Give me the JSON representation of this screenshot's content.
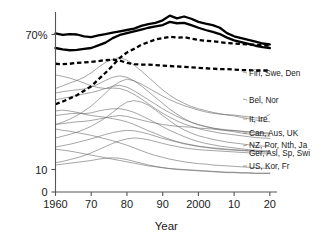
{
  "chart_data": {
    "type": "line",
    "title": "",
    "subtitle": "",
    "xlabel": "Year",
    "ylabel": "",
    "xlim": [
      1960,
      2022
    ],
    "ylim": [
      0,
      80
    ],
    "grid": false,
    "legend_position": "right-inline-labels",
    "x_ticks": [
      {
        "value": 1960,
        "label": "1960"
      },
      {
        "value": 1970,
        "label": "70"
      },
      {
        "value": 1980,
        "label": "80"
      },
      {
        "value": 1990,
        "label": "90"
      },
      {
        "value": 2000,
        "label": "2000"
      },
      {
        "value": 2010,
        "label": "10"
      },
      {
        "value": 2020,
        "label": "20"
      }
    ],
    "y_ticks": [
      {
        "value": 70,
        "label": "70%"
      },
      {
        "value": 10,
        "label": "10"
      },
      {
        "value": 0,
        "label": "0"
      }
    ],
    "x": [
      1960,
      1962,
      1964,
      1966,
      1968,
      1970,
      1972,
      1974,
      1976,
      1978,
      1980,
      1982,
      1984,
      1986,
      1988,
      1990,
      1992,
      1994,
      1996,
      1998,
      2000,
      2002,
      2004,
      2006,
      2008,
      2010,
      2012,
      2014,
      2016,
      2018,
      2020
    ],
    "series": [
      {
        "name": "Fin, Swe, Den",
        "label": "Fin, Swe, Den",
        "style": "thick-solid",
        "emphasis": true,
        "values": [
          70.5,
          69.8,
          70.2,
          70.0,
          69.2,
          68.8,
          69.6,
          70.2,
          70.8,
          71.4,
          72.0,
          72.6,
          73.8,
          74.6,
          75.2,
          76.3,
          78.4,
          77.2,
          78.0,
          77.0,
          75.6,
          74.8,
          74.2,
          73.0,
          70.6,
          69.2,
          68.4,
          67.6,
          66.8,
          66.0,
          65.6
        ]
      },
      {
        "name": "Fin, Swe, Den upper variant",
        "label": "",
        "style": "thick-solid",
        "emphasis": true,
        "values": [
          64.0,
          63.4,
          63.0,
          63.2,
          63.6,
          64.0,
          65.2,
          66.4,
          68.4,
          69.8,
          70.6,
          71.4,
          72.2,
          73.0,
          73.6,
          74.2,
          75.6,
          75.0,
          75.2,
          74.2,
          73.0,
          72.0,
          71.2,
          70.2,
          68.6,
          67.4,
          66.6,
          65.8,
          65.0,
          64.4,
          64.0
        ]
      },
      {
        "name": "Bel, Nor",
        "label": "Bel, Nor",
        "style": "thick-dashed",
        "emphasis": true,
        "values": [
          39.0,
          40.2,
          41.6,
          43.0,
          45.0,
          47.0,
          50.0,
          53.0,
          56.2,
          59.6,
          62.0,
          63.6,
          65.4,
          66.6,
          67.8,
          68.4,
          69.0,
          68.6,
          68.8,
          68.2,
          67.6,
          67.2,
          67.0,
          66.6,
          66.2,
          66.0,
          65.8,
          65.6,
          65.4,
          65.2,
          65.0
        ]
      },
      {
        "name": "Bel, Nor lower",
        "label": "",
        "style": "thick-dashed",
        "emphasis": true,
        "values": [
          57.0,
          56.8,
          57.0,
          57.4,
          57.6,
          57.8,
          58.2,
          58.6,
          58.8,
          58.4,
          57.4,
          56.8,
          56.6,
          56.6,
          56.4,
          56.2,
          56.0,
          55.8,
          55.6,
          55.4,
          55.2,
          55.0,
          54.8,
          54.6,
          54.6,
          54.4,
          54.2,
          54.2,
          54.0,
          54.0,
          54.0
        ]
      },
      {
        "name": "It, Ire",
        "label": "It, Ire",
        "style": "thin",
        "emphasis": false,
        "values": [
          30.0,
          31.0,
          32.4,
          34.0,
          36.0,
          38.2,
          41.0,
          44.0,
          47.0,
          49.0,
          50.2,
          49.4,
          48.0,
          46.2,
          44.4,
          42.6,
          41.0,
          39.6,
          38.4,
          37.4,
          36.4,
          35.6,
          35.0,
          34.6,
          34.4,
          34.2,
          33.8,
          33.4,
          33.0,
          32.8,
          34.4
        ]
      },
      {
        "name": "It, Ire second",
        "label": "",
        "style": "thin",
        "emphasis": false,
        "values": [
          46.0,
          47.2,
          48.4,
          49.6,
          51.0,
          53.0,
          55.4,
          57.6,
          59.0,
          59.8,
          58.6,
          56.4,
          53.8,
          51.0,
          48.2,
          45.4,
          43.0,
          41.0,
          39.4,
          38.0,
          37.0,
          36.2,
          35.4,
          34.8,
          34.2,
          33.8,
          33.2,
          32.6,
          32.0,
          31.6,
          31.2
        ]
      },
      {
        "name": "Can, Aus, UK",
        "label": "Can, Aus, UK",
        "style": "thin",
        "emphasis": false,
        "values": [
          44.0,
          44.6,
          45.0,
          45.4,
          45.8,
          46.6,
          48.0,
          49.6,
          51.0,
          51.6,
          51.0,
          49.4,
          47.2,
          44.6,
          42.0,
          39.4,
          36.8,
          34.6,
          32.6,
          31.0,
          29.8,
          29.0,
          28.4,
          28.0,
          27.6,
          27.4,
          27.0,
          26.6,
          26.2,
          26.0,
          25.8
        ]
      },
      {
        "name": "Can, Aus, UK second",
        "label": "",
        "style": "thin",
        "emphasis": false,
        "values": [
          30.0,
          30.4,
          30.8,
          31.2,
          31.4,
          31.8,
          32.4,
          33.0,
          33.6,
          34.0,
          33.6,
          32.8,
          32.0,
          31.2,
          30.6,
          30.0,
          29.6,
          29.2,
          29.0,
          28.8,
          28.4,
          28.2,
          28.0,
          27.6,
          27.4,
          27.2,
          27.0,
          26.8,
          26.6,
          26.4,
          26.2
        ]
      },
      {
        "name": "NZ, Por, Nth, Ja",
        "label": "NZ, Por, Nth, Ja",
        "style": "thin",
        "emphasis": false,
        "values": [
          36.0,
          36.4,
          36.0,
          35.4,
          34.6,
          34.0,
          33.6,
          33.2,
          32.6,
          32.0,
          31.2,
          30.0,
          28.6,
          27.2,
          26.0,
          24.6,
          23.4,
          22.4,
          21.6,
          21.0,
          20.4,
          20.0,
          19.6,
          19.4,
          19.0,
          18.8,
          18.6,
          18.4,
          18.2,
          18.0,
          18.0
        ]
      },
      {
        "name": "Ger, Asl, Sp, Swi",
        "label": "Ger, Asl, Sp, Swi",
        "style": "thin",
        "emphasis": false,
        "values": [
          34.0,
          34.4,
          34.8,
          35.0,
          34.8,
          35.2,
          36.0,
          36.6,
          37.0,
          37.0,
          36.4,
          35.4,
          34.0,
          32.4,
          30.8,
          29.0,
          27.4,
          26.0,
          24.6,
          23.4,
          22.4,
          21.6,
          21.0,
          20.4,
          20.0,
          19.6,
          19.2,
          18.8,
          18.6,
          18.4,
          18.2
        ]
      },
      {
        "name": "Ger second",
        "label": "",
        "style": "thin",
        "emphasis": false,
        "values": [
          20.0,
          20.6,
          21.2,
          22.0,
          22.8,
          23.6,
          24.6,
          25.6,
          26.4,
          27.0,
          27.4,
          27.2,
          26.6,
          25.8,
          24.8,
          23.8,
          23.0,
          22.2,
          21.4,
          20.8,
          20.2,
          19.8,
          19.4,
          19.0,
          18.8,
          18.6,
          18.4,
          18.2,
          18.0,
          17.8,
          17.6
        ]
      },
      {
        "name": "Sp, Swi low",
        "label": "",
        "style": "thin",
        "emphasis": false,
        "values": [
          13.0,
          13.6,
          14.4,
          15.2,
          16.2,
          17.4,
          18.8,
          20.2,
          21.6,
          22.8,
          23.6,
          24.0,
          23.8,
          23.2,
          22.4,
          21.6,
          20.8,
          20.2,
          19.6,
          19.2,
          18.8,
          18.6,
          18.4,
          18.2,
          18.0,
          17.8,
          17.6,
          17.4,
          17.2,
          17.0,
          17.0
        ]
      },
      {
        "name": "US, Kor, Fr",
        "label": "US, Kor, Fr",
        "style": "thin",
        "emphasis": false,
        "values": [
          28.0,
          27.4,
          27.0,
          26.4,
          25.8,
          25.2,
          24.4,
          23.6,
          22.8,
          21.8,
          20.8,
          19.6,
          18.4,
          17.2,
          16.2,
          15.4,
          14.6,
          14.0,
          13.4,
          13.0,
          12.6,
          12.4,
          12.0,
          11.8,
          11.6,
          11.4,
          11.2,
          11.0,
          10.8,
          10.6,
          10.4
        ]
      },
      {
        "name": "US, Kor, Fr second",
        "label": "",
        "style": "thin",
        "emphasis": false,
        "values": [
          19.0,
          18.6,
          18.2,
          17.6,
          17.0,
          16.4,
          15.8,
          15.2,
          14.6,
          14.0,
          13.4,
          12.8,
          12.2,
          11.6,
          11.2,
          10.8,
          10.4,
          10.2,
          10.0,
          9.8,
          9.6,
          9.4,
          9.2,
          9.0,
          8.8,
          8.8,
          8.6,
          8.6,
          8.4,
          8.4,
          8.4
        ]
      },
      {
        "name": "Fr lowest",
        "label": "",
        "style": "thin",
        "emphasis": false,
        "values": [
          12.0,
          12.4,
          12.8,
          13.2,
          13.6,
          14.0,
          14.6,
          15.0,
          15.2,
          15.0,
          14.4,
          13.6,
          12.8,
          12.0,
          11.4,
          10.8,
          10.4,
          10.0,
          9.8,
          9.6,
          9.4,
          9.2,
          9.0,
          8.8,
          8.6,
          8.6,
          8.4,
          8.4,
          8.2,
          8.2,
          8.2
        ]
      },
      {
        "name": "mid band a",
        "label": "",
        "style": "thin",
        "emphasis": false,
        "values": [
          24.0,
          24.8,
          25.6,
          26.6,
          27.8,
          29.2,
          31.0,
          33.0,
          35.4,
          38.0,
          40.0,
          40.6,
          40.0,
          38.6,
          36.4,
          34.0,
          31.6,
          29.4,
          27.6,
          26.2,
          25.0,
          24.2,
          23.4,
          22.8,
          22.2,
          21.8,
          21.4,
          21.0,
          20.6,
          20.4,
          20.2
        ]
      },
      {
        "name": "mid band b",
        "label": "",
        "style": "thin",
        "emphasis": false,
        "values": [
          52.0,
          51.4,
          50.6,
          49.6,
          48.4,
          47.2,
          46.4,
          46.0,
          46.2,
          46.0,
          45.0,
          43.4,
          41.4,
          39.2,
          37.0,
          35.0,
          33.2,
          31.6,
          30.2,
          29.2,
          28.2,
          27.4,
          26.8,
          26.2,
          25.8,
          25.4,
          25.0,
          24.6,
          24.2,
          24.0,
          23.8
        ]
      },
      {
        "name": "mid band c",
        "label": "",
        "style": "thin",
        "emphasis": false,
        "values": [
          41.0,
          41.6,
          42.2,
          43.0,
          43.6,
          44.2,
          45.0,
          46.0,
          47.0,
          47.4,
          46.6,
          45.0,
          43.0,
          41.0,
          39.0,
          37.0,
          35.2,
          33.6,
          32.2,
          31.0,
          30.0,
          29.2,
          28.4,
          27.8,
          27.2,
          26.8,
          26.2,
          25.8,
          25.4,
          25.0,
          24.8
        ]
      }
    ],
    "annotations": []
  }
}
